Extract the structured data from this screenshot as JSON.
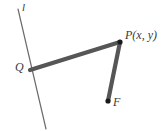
{
  "figure": {
    "background_color": "#ffffff",
    "width": 168,
    "height": 131,
    "labels": {
      "directrix": "l",
      "foot_point": "Q",
      "moving_point": "P(x, y)",
      "focus": "F"
    },
    "colors": {
      "directrix_line": "#6b6b6b",
      "thick_segment": "#565656",
      "point_dot": "#1a1a1a",
      "label_text": "#3a3a3a"
    },
    "geometry": {
      "directrix": {
        "name": "directrix-line-l",
        "x1": 18,
        "y1": 9,
        "x2": 46,
        "y2": 129,
        "stroke_width": 1.2
      },
      "segment_qp": {
        "name": "segment-q-to-p",
        "x1": 30,
        "y1": 70,
        "x2": 120,
        "y2": 42,
        "stroke_width": 4.2
      },
      "segment_pf": {
        "name": "segment-p-to-f",
        "x1": 120,
        "y1": 42,
        "x2": 108,
        "y2": 101,
        "stroke_width": 4.2
      },
      "points": [
        {
          "name": "point-p",
          "cx": 120,
          "cy": 42,
          "r": 2.6
        },
        {
          "name": "point-f",
          "cx": 108,
          "cy": 101,
          "r": 2.6
        }
      ]
    }
  }
}
